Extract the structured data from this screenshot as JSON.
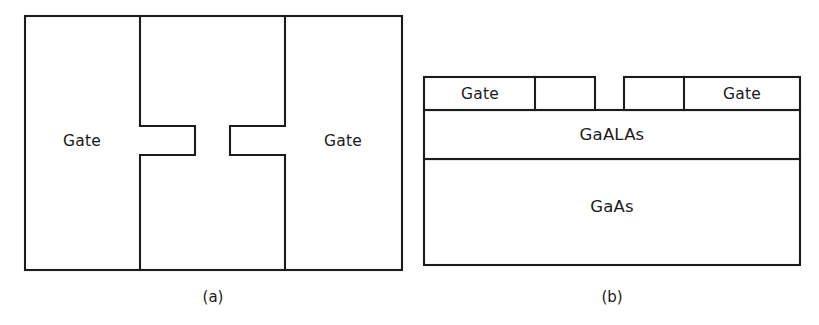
{
  "figure": {
    "background_color": "#ffffff",
    "line_color": "#1c1c1c",
    "text_color": "#1a1a1a",
    "width": 819,
    "height": 325
  },
  "panels": [
    {
      "id": "panel-a",
      "caption": "(a)",
      "view": "top view",
      "caption_x": 213,
      "caption_y": 297,
      "outline": {
        "x": 25,
        "y": 16,
        "width": 377,
        "height": 254
      },
      "labels": [
        {
          "name": "left-gate-label",
          "text": "Gate",
          "x": 82,
          "y": 141
        },
        {
          "name": "right-gate-label",
          "text": "Gate",
          "x": 343,
          "y": 141
        }
      ],
      "electrodes": {
        "left_divider_x": 140,
        "right_divider_x": 285,
        "notch_top_y": 126,
        "notch_bottom_y": 155,
        "left_notch_tip_x": 195,
        "right_notch_tip_x": 230
      }
    },
    {
      "id": "panel-b",
      "caption": "(b)",
      "view": "cross section",
      "caption_x": 612,
      "caption_y": 297,
      "outline": {
        "x": 424,
        "y": 77,
        "width": 376,
        "height": 188
      },
      "gate_layer": {
        "top_y": 77,
        "bottom_y": 110,
        "left_x": 424,
        "right_x": 800,
        "divider_left_x": 535,
        "gap_start_x": 595,
        "gap_end_x": 624,
        "divider_right_x": 684
      },
      "layers": [
        {
          "name": "gaalas-layer",
          "text": "GaALAs",
          "top_y": 110,
          "bottom_y": 159,
          "label_x": 612,
          "label_y": 135
        },
        {
          "name": "gaas-layer",
          "text": "GaAs",
          "top_y": 159,
          "bottom_y": 265,
          "label_x": 612,
          "label_y": 207
        }
      ],
      "labels": [
        {
          "name": "left-gate-label",
          "text": "Gate",
          "x": 480,
          "y": 94
        },
        {
          "name": "right-gate-label",
          "text": "Gate",
          "x": 742,
          "y": 94
        }
      ]
    }
  ]
}
